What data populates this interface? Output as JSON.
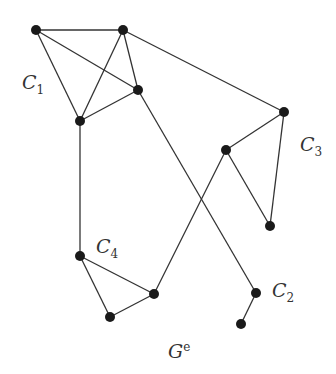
{
  "labels": {
    "c1": {
      "main": "C",
      "sub": "1"
    },
    "c2": {
      "main": "C",
      "sub": "2"
    },
    "c3": {
      "main": "C",
      "sub": "3"
    },
    "c4": {
      "main": "C",
      "sub": "4"
    },
    "graph": {
      "main": "G",
      "sup": "e"
    }
  },
  "nodes": [
    {
      "id": "a",
      "x": 36,
      "y": 30
    },
    {
      "id": "b",
      "x": 123,
      "y": 30
    },
    {
      "id": "c",
      "x": 138,
      "y": 90
    },
    {
      "id": "d",
      "x": 80,
      "y": 121
    },
    {
      "id": "e",
      "x": 284,
      "y": 112
    },
    {
      "id": "f",
      "x": 226,
      "y": 150
    },
    {
      "id": "g",
      "x": 270,
      "y": 226
    },
    {
      "id": "h",
      "x": 80,
      "y": 256
    },
    {
      "id": "i",
      "x": 154,
      "y": 294
    },
    {
      "id": "j",
      "x": 110,
      "y": 317
    },
    {
      "id": "k",
      "x": 256,
      "y": 293
    },
    {
      "id": "l",
      "x": 241,
      "y": 324
    }
  ],
  "edges": [
    [
      "a",
      "b"
    ],
    [
      "a",
      "c"
    ],
    [
      "a",
      "d"
    ],
    [
      "b",
      "d"
    ],
    [
      "b",
      "c"
    ],
    [
      "d",
      "c"
    ],
    [
      "b",
      "e"
    ],
    [
      "e",
      "f"
    ],
    [
      "e",
      "g"
    ],
    [
      "f",
      "g"
    ],
    [
      "d",
      "h"
    ],
    [
      "h",
      "i"
    ],
    [
      "h",
      "j"
    ],
    [
      "j",
      "i"
    ],
    [
      "i",
      "f"
    ],
    [
      "c",
      "k"
    ],
    [
      "k",
      "l"
    ]
  ],
  "colors": {
    "stroke": "#333333",
    "node": "#1a1a1a"
  }
}
